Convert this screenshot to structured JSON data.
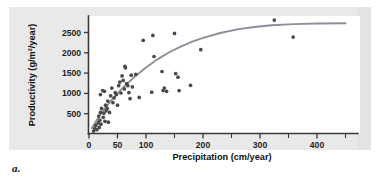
{
  "figure": {
    "caption_label": "a.",
    "panel_color": "#e9e9e9",
    "plot_background": "#ffffff",
    "point_color": "#4a4a4a",
    "curve_color": "#8a8f98",
    "axis_color": "#3a3a3a"
  },
  "chart_data": {
    "type": "scatter",
    "title": "",
    "xlabel": "Precipitation (cm/year)",
    "ylabel": "Productivity (g/m²/year)",
    "xlim": [
      0,
      460
    ],
    "ylim": [
      0,
      2900
    ],
    "xticks": [
      0,
      50,
      100,
      200,
      300,
      400
    ],
    "xtick_labels": [
      "0",
      "50",
      "100",
      "200",
      "300",
      "400"
    ],
    "xticks_minor": [
      150,
      250,
      350,
      450
    ],
    "yticks": [
      500,
      1000,
      1500,
      2000,
      2500
    ],
    "ytick_labels": [
      "500",
      "1000",
      "1500",
      "2000",
      "2500"
    ],
    "grid": false,
    "legend": null,
    "series": [
      {
        "name": "Observations",
        "marker": "circle",
        "color": "#4a4a4a",
        "points": [
          [
            8,
            60
          ],
          [
            10,
            120
          ],
          [
            12,
            200
          ],
          [
            14,
            95
          ],
          [
            16,
            260
          ],
          [
            17,
            430
          ],
          [
            18,
            150
          ],
          [
            19,
            330
          ],
          [
            20,
            960
          ],
          [
            20,
            520
          ],
          [
            21,
            230
          ],
          [
            22,
            620
          ],
          [
            24,
            1060
          ],
          [
            25,
            400
          ],
          [
            26,
            500
          ],
          [
            27,
            1040
          ],
          [
            28,
            300
          ],
          [
            29,
            700
          ],
          [
            30,
            560
          ],
          [
            32,
            620
          ],
          [
            33,
            800
          ],
          [
            34,
            280
          ],
          [
            36,
            520
          ],
          [
            38,
            930
          ],
          [
            40,
            1120
          ],
          [
            42,
            760
          ],
          [
            44,
            880
          ],
          [
            46,
            1010
          ],
          [
            48,
            960
          ],
          [
            50,
            700
          ],
          [
            52,
            1180
          ],
          [
            54,
            1270
          ],
          [
            56,
            1000
          ],
          [
            58,
            1420
          ],
          [
            60,
            1310
          ],
          [
            62,
            1100
          ],
          [
            63,
            1660
          ],
          [
            64,
            1620
          ],
          [
            66,
            1230
          ],
          [
            68,
            1180
          ],
          [
            70,
            1010
          ],
          [
            72,
            860
          ],
          [
            74,
            1440
          ],
          [
            76,
            1150
          ],
          [
            82,
            1460
          ],
          [
            88,
            890
          ],
          [
            95,
            2300
          ],
          [
            110,
            1020
          ],
          [
            112,
            2420
          ],
          [
            114,
            1900
          ],
          [
            128,
            1530
          ],
          [
            130,
            1060
          ],
          [
            132,
            1120
          ],
          [
            136,
            1040
          ],
          [
            150,
            2470
          ],
          [
            152,
            1480
          ],
          [
            156,
            1390
          ],
          [
            158,
            1060
          ],
          [
            178,
            1190
          ],
          [
            196,
            2070
          ],
          [
            325,
            2800
          ],
          [
            358,
            2380
          ]
        ]
      }
    ],
    "fit_curve": {
      "name": "Saturating fit",
      "color": "#8a8f98",
      "description": "Asymptotic (saturating) trend line rising steeply at low precipitation and leveling near 2700 g/m²/year",
      "points": [
        [
          5,
          130
        ],
        [
          20,
          480
        ],
        [
          40,
          830
        ],
        [
          60,
          1140
        ],
        [
          80,
          1400
        ],
        [
          100,
          1630
        ],
        [
          120,
          1830
        ],
        [
          140,
          2000
        ],
        [
          160,
          2140
        ],
        [
          180,
          2260
        ],
        [
          200,
          2360
        ],
        [
          230,
          2480
        ],
        [
          260,
          2570
        ],
        [
          290,
          2630
        ],
        [
          320,
          2670
        ],
        [
          360,
          2700
        ],
        [
          400,
          2715
        ],
        [
          450,
          2720
        ]
      ]
    }
  }
}
